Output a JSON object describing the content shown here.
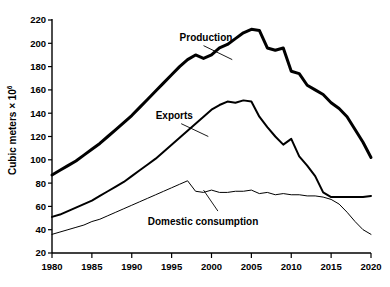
{
  "chart_data": {
    "type": "line",
    "title": "",
    "xlabel": "",
    "ylabel": "Cubic meters × 10",
    "ylabel_exponent": "6",
    "xlim": [
      1980,
      2020
    ],
    "ylim": [
      20,
      220
    ],
    "grid": false,
    "legend_position": "inline-annotations",
    "xticks": [
      1980,
      1985,
      1990,
      1995,
      2000,
      2005,
      2010,
      2015,
      2020
    ],
    "xtick_labels": [
      "1980",
      "1985",
      "1990",
      "1995",
      "2000",
      "2005",
      "2010",
      "2015",
      "2020"
    ],
    "yticks": [
      20,
      40,
      60,
      80,
      100,
      120,
      140,
      160,
      180,
      200,
      220
    ],
    "ytick_labels": [
      "20",
      "40",
      "60",
      "80",
      "100",
      "120",
      "140",
      "160",
      "180",
      "200",
      "220"
    ],
    "x": [
      1980,
      1981,
      1982,
      1983,
      1984,
      1985,
      1986,
      1987,
      1988,
      1989,
      1990,
      1991,
      1992,
      1993,
      1994,
      1995,
      1996,
      1997,
      1998,
      1999,
      2000,
      2001,
      2002,
      2003,
      2004,
      2005,
      2006,
      2007,
      2008,
      2009,
      2010,
      2011,
      2012,
      2013,
      2014,
      2015,
      2016,
      2017,
      2018,
      2019,
      2020
    ],
    "series": [
      {
        "name": "Production",
        "label": "Production",
        "line_weight": "thick",
        "values": [
          87,
          91,
          95,
          99,
          104,
          109,
          114,
          120,
          126,
          132,
          138,
          145,
          152,
          159,
          166,
          173,
          180,
          186,
          190,
          187,
          190,
          196,
          199,
          204,
          209,
          212,
          211,
          196,
          194,
          196,
          176,
          174,
          164,
          160,
          156,
          149,
          144,
          137,
          126,
          115,
          102
        ]
      },
      {
        "name": "Exports",
        "label": "Exports",
        "line_weight": "medium",
        "values": [
          51,
          53,
          56,
          59,
          62,
          65,
          69,
          73,
          77,
          81,
          86,
          91,
          96,
          101,
          107,
          113,
          119,
          125,
          131,
          137,
          143,
          147,
          150,
          149,
          151,
          150,
          137,
          128,
          120,
          113,
          118,
          103,
          95,
          86,
          72,
          68,
          68,
          68,
          68,
          68,
          69
        ]
      },
      {
        "name": "Domestic consumption",
        "label": "Domestic consumption",
        "line_weight": "thin",
        "values": [
          36,
          38,
          40,
          42,
          44,
          47,
          49,
          52,
          55,
          58,
          61,
          64,
          67,
          70,
          73,
          76,
          79,
          82,
          73,
          72,
          74,
          72,
          72,
          73,
          73,
          74,
          71,
          72,
          70,
          71,
          70,
          70,
          69,
          69,
          68,
          66,
          62,
          55,
          47,
          40,
          36
        ]
      }
    ],
    "annotations": [
      {
        "text": "Production",
        "x": 1996,
        "y": 205
      },
      {
        "text": "Exports",
        "x": 1993,
        "y": 138
      },
      {
        "text": "Domestic consumption",
        "x": 1992,
        "y": 47
      }
    ]
  },
  "colors": {
    "background": "#ffffff",
    "ink": "#000000"
  }
}
